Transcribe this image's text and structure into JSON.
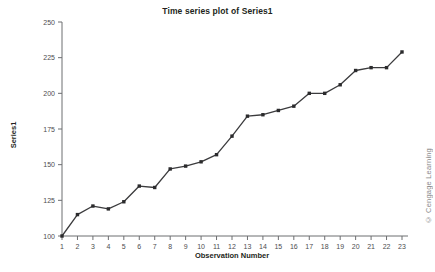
{
  "chart_data": {
    "type": "line",
    "title": "Time series plot of Series1",
    "xlabel": "Observation Number",
    "ylabel": "Series1",
    "x": [
      1,
      2,
      3,
      4,
      5,
      6,
      7,
      8,
      9,
      10,
      11,
      12,
      13,
      14,
      15,
      16,
      17,
      18,
      19,
      20,
      21,
      22,
      23
    ],
    "values": [
      100,
      115,
      121,
      119,
      124,
      135,
      134,
      147,
      149,
      152,
      157,
      170,
      184,
      185,
      188,
      191,
      200,
      200,
      206,
      216,
      218,
      218,
      229
    ],
    "series": [
      {
        "name": "Series1",
        "values": [
          100,
          115,
          121,
          119,
          124,
          135,
          134,
          147,
          149,
          152,
          157,
          170,
          184,
          185,
          188,
          191,
          200,
          200,
          206,
          216,
          218,
          218,
          229
        ]
      }
    ],
    "xlim": [
      1,
      23
    ],
    "ylim": [
      100,
      250
    ],
    "yticks": [
      100,
      125,
      150,
      175,
      200,
      225,
      250
    ],
    "xticks": [
      1,
      2,
      3,
      4,
      5,
      6,
      7,
      8,
      9,
      10,
      11,
      12,
      13,
      14,
      15,
      16,
      17,
      18,
      19,
      20,
      21,
      22,
      23
    ],
    "xtick_labels": [
      "1",
      "2",
      "3",
      "4",
      "5",
      "6",
      "7",
      "8",
      "9",
      "10",
      "11",
      "12",
      "13",
      "14",
      "15",
      "16",
      "17",
      "18",
      "19",
      "20",
      "21",
      "22",
      "23"
    ],
    "ytick_labels": [
      "100",
      "125",
      "150",
      "175",
      "200",
      "225",
      "250"
    ],
    "grid": false,
    "legend": null,
    "line_color": "#3b3b3d",
    "marker": "square",
    "marker_color": "#2b2b2d"
  },
  "credit": {
    "text": "© Cengage Learning"
  }
}
